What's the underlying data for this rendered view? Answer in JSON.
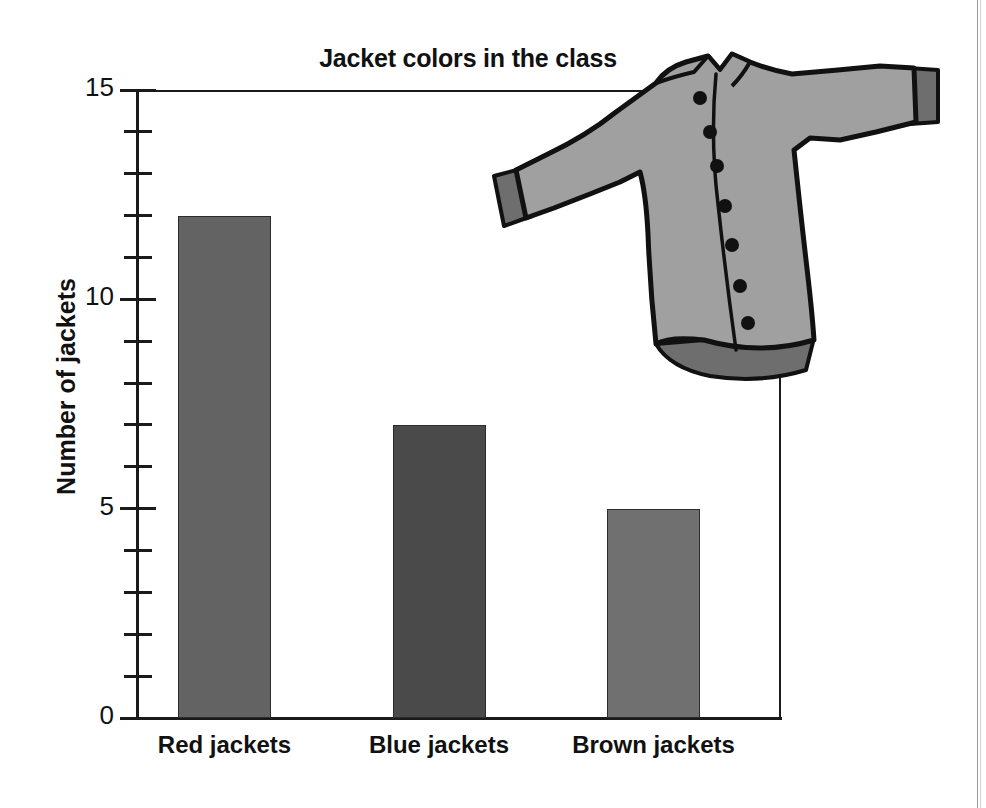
{
  "chart_data": {
    "type": "bar",
    "title": "Jacket colors in the class",
    "xlabel": "",
    "ylabel": "Number of jackets",
    "categories": [
      "Red jackets",
      "Blue jackets",
      "Brown jackets"
    ],
    "values": [
      12,
      7,
      5
    ],
    "ylim": [
      0,
      15
    ],
    "y_tick_labels": [
      "0",
      "5",
      "10",
      "15"
    ],
    "y_major_ticks": [
      0,
      5,
      10,
      15
    ],
    "y_minor_tick_interval": 1,
    "grid": false,
    "legend": "none",
    "bar_colors": [
      "#636363",
      "#4a4a4a",
      "#707070"
    ],
    "bar_border_color": "#2b2b2b",
    "axis_color": "#1a1a1a",
    "background_color": "#ffffff"
  },
  "illustration": {
    "name": "jacket-clipart",
    "description": "Grey buttoned jacket",
    "body_color": "#a0a0a0",
    "trim_color": "#6e6e6e",
    "outline_color": "#111111",
    "button_color": "#111111",
    "button_count": 7
  },
  "page": {
    "edge_color": "#9a9a9a"
  }
}
